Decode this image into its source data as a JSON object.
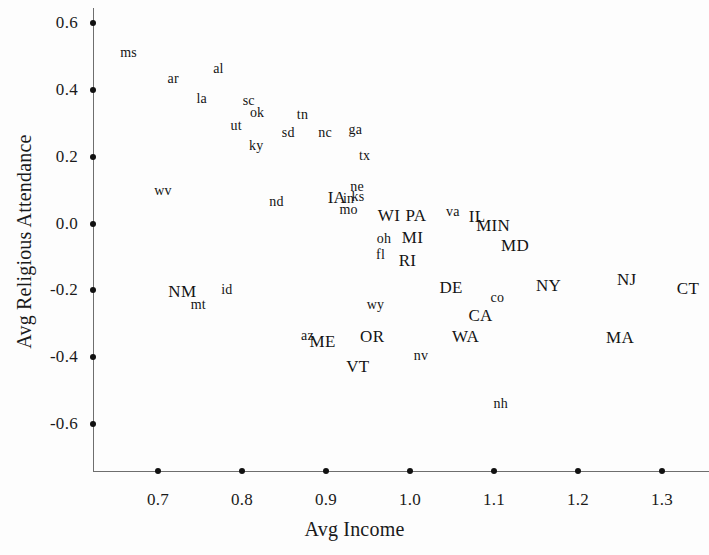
{
  "chart_data": {
    "type": "scatter",
    "title": "",
    "xlabel": "Avg Income",
    "ylabel": "Avg Religious Attendance",
    "xlim": [
      0.645,
      1.34
    ],
    "ylim": [
      -0.74,
      0.62
    ],
    "xticks": [
      "0.7",
      "0.8",
      "0.9",
      "1.0",
      "1.1",
      "1.2",
      "1.3"
    ],
    "xtick_values": [
      0.7,
      0.8,
      0.9,
      1.0,
      1.1,
      1.2,
      1.3
    ],
    "yticks": [
      "0.6",
      "0.4",
      "0.2",
      "0.0",
      "-0.2",
      "-0.4",
      "-0.6"
    ],
    "ytick_values": [
      0.6,
      0.4,
      0.2,
      0.0,
      -0.2,
      -0.4,
      -0.6
    ],
    "grid": false,
    "legend": null,
    "marker": "text-label",
    "note": "Each point is rendered as its state abbreviation text; lowercase = low-income states, uppercase = high-income states.",
    "points": [
      {
        "label": "ms",
        "x": 0.665,
        "y": 0.509,
        "case": "lower"
      },
      {
        "label": "ar",
        "x": 0.718,
        "y": 0.433,
        "case": "lower"
      },
      {
        "label": "al",
        "x": 0.772,
        "y": 0.462,
        "case": "lower"
      },
      {
        "label": "la",
        "x": 0.752,
        "y": 0.374,
        "case": "lower"
      },
      {
        "label": "sc",
        "x": 0.808,
        "y": 0.368,
        "case": "lower"
      },
      {
        "label": "ok",
        "x": 0.818,
        "y": 0.332,
        "case": "lower"
      },
      {
        "label": "tn",
        "x": 0.872,
        "y": 0.325,
        "case": "lower"
      },
      {
        "label": "ut",
        "x": 0.793,
        "y": 0.293,
        "case": "lower"
      },
      {
        "label": "sd",
        "x": 0.855,
        "y": 0.272,
        "case": "lower"
      },
      {
        "label": "nc",
        "x": 0.899,
        "y": 0.272,
        "case": "lower"
      },
      {
        "label": "ga",
        "x": 0.935,
        "y": 0.281,
        "case": "lower"
      },
      {
        "label": "ky",
        "x": 0.817,
        "y": 0.232,
        "case": "lower"
      },
      {
        "label": "tx",
        "x": 0.946,
        "y": 0.203,
        "case": "lower"
      },
      {
        "label": "wv",
        "x": 0.706,
        "y": 0.098,
        "case": "lower"
      },
      {
        "label": "nd",
        "x": 0.841,
        "y": 0.063,
        "case": "lower"
      },
      {
        "label": "ne",
        "x": 0.937,
        "y": 0.11,
        "case": "lower"
      },
      {
        "label": "ks",
        "x": 0.938,
        "y": 0.08,
        "case": "lower"
      },
      {
        "label": "IA",
        "x": 0.913,
        "y": 0.077,
        "case": "upper"
      },
      {
        "label": "in",
        "x": 0.927,
        "y": 0.074,
        "case": "lower"
      },
      {
        "label": "mo",
        "x": 0.927,
        "y": 0.039,
        "case": "lower"
      },
      {
        "label": "WI",
        "x": 0.975,
        "y": 0.021,
        "case": "upper"
      },
      {
        "label": "PA",
        "x": 1.007,
        "y": 0.021,
        "case": "upper"
      },
      {
        "label": "va",
        "x": 1.051,
        "y": 0.034,
        "case": "lower"
      },
      {
        "label": "IL",
        "x": 1.08,
        "y": 0.018,
        "case": "upper"
      },
      {
        "label": "MIN",
        "x": 1.099,
        "y": -0.006,
        "case": "upper"
      },
      {
        "label": "oh",
        "x": 0.969,
        "y": -0.045,
        "case": "lower"
      },
      {
        "label": "MI",
        "x": 1.003,
        "y": -0.042,
        "case": "upper"
      },
      {
        "label": "MD",
        "x": 1.125,
        "y": -0.068,
        "case": "upper"
      },
      {
        "label": "fl",
        "x": 0.965,
        "y": -0.095,
        "case": "lower"
      },
      {
        "label": "RI",
        "x": 0.997,
        "y": -0.113,
        "case": "upper"
      },
      {
        "label": "NM",
        "x": 0.729,
        "y": -0.206,
        "case": "upper"
      },
      {
        "label": "id",
        "x": 0.782,
        "y": -0.2,
        "case": "lower"
      },
      {
        "label": "DE",
        "x": 1.049,
        "y": -0.194,
        "case": "upper"
      },
      {
        "label": "NY",
        "x": 1.165,
        "y": -0.188,
        "case": "upper"
      },
      {
        "label": "NJ",
        "x": 1.258,
        "y": -0.17,
        "case": "upper"
      },
      {
        "label": "CT",
        "x": 1.331,
        "y": -0.197,
        "case": "upper"
      },
      {
        "label": "mt",
        "x": 0.748,
        "y": -0.245,
        "case": "lower"
      },
      {
        "label": "wy",
        "x": 0.959,
        "y": -0.243,
        "case": "lower"
      },
      {
        "label": "co",
        "x": 1.104,
        "y": -0.224,
        "case": "lower"
      },
      {
        "label": "CA",
        "x": 1.084,
        "y": -0.278,
        "case": "upper"
      },
      {
        "label": "az",
        "x": 0.878,
        "y": -0.337,
        "case": "lower"
      },
      {
        "label": "ME",
        "x": 0.896,
        "y": -0.356,
        "case": "upper"
      },
      {
        "label": "OR",
        "x": 0.955,
        "y": -0.34,
        "case": "upper"
      },
      {
        "label": "WA",
        "x": 1.066,
        "y": -0.34,
        "case": "upper"
      },
      {
        "label": "MA",
        "x": 1.25,
        "y": -0.343,
        "case": "upper"
      },
      {
        "label": "nv",
        "x": 1.013,
        "y": -0.398,
        "case": "lower"
      },
      {
        "label": "VT",
        "x": 0.938,
        "y": -0.43,
        "case": "upper"
      },
      {
        "label": "nh",
        "x": 1.108,
        "y": -0.54,
        "case": "lower"
      }
    ]
  }
}
